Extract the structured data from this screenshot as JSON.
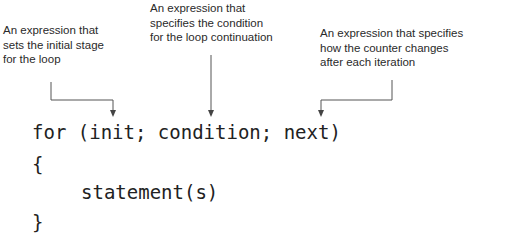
{
  "annotations": {
    "init": {
      "lines": [
        "An expression that",
        "sets the initial stage",
        "for the loop"
      ]
    },
    "condition": {
      "lines": [
        "An expression that",
        "specifies the condition",
        "for the loop continuation"
      ]
    },
    "next": {
      "lines": [
        "An expression that specifies",
        "how the counter changes",
        "after each iteration"
      ]
    }
  },
  "code": {
    "header": "for (init; condition; next)",
    "open_brace": "{",
    "body": "statement(s)",
    "close_brace": "}"
  },
  "colors": {
    "text": "#2a2a2a",
    "code": "#222222",
    "arrow": "#555555",
    "background": "#ffffff"
  }
}
